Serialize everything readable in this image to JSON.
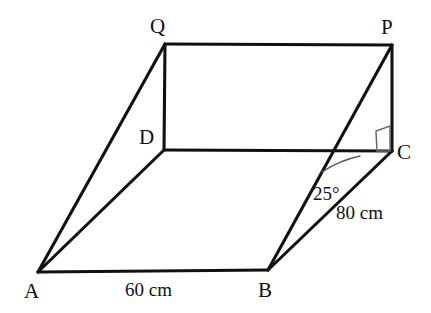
{
  "figure": {
    "stroke_color": "#111111",
    "marker_color": "#6a6a6a",
    "background_color": "#ffffff",
    "vertices": [
      {
        "name": "A",
        "label": "A",
        "x": 38,
        "y": 272
      },
      {
        "name": "B",
        "label": "B",
        "x": 268,
        "y": 270
      },
      {
        "name": "C",
        "label": "C",
        "x": 392,
        "y": 151
      },
      {
        "name": "D",
        "label": "D",
        "x": 164,
        "y": 150
      },
      {
        "name": "P",
        "label": "P",
        "x": 392,
        "y": 45
      },
      {
        "name": "Q",
        "label": "Q",
        "x": 165,
        "y": 44
      }
    ],
    "edges": [
      {
        "name": "edge-AB",
        "from": "A",
        "to": "B"
      },
      {
        "name": "edge-BC",
        "from": "B",
        "to": "C"
      },
      {
        "name": "edge-CD",
        "from": "C",
        "to": "D"
      },
      {
        "name": "edge-DA",
        "from": "D",
        "to": "A"
      },
      {
        "name": "edge-QP",
        "from": "Q",
        "to": "P"
      },
      {
        "name": "edge-QD",
        "from": "Q",
        "to": "D"
      },
      {
        "name": "edge-PC",
        "from": "P",
        "to": "C"
      },
      {
        "name": "edge-AQ",
        "from": "A",
        "to": "Q"
      },
      {
        "name": "edge-BP",
        "from": "B",
        "to": "P"
      }
    ],
    "dimensions": [
      {
        "name": "length-AB",
        "text": "60 cm",
        "value": 60,
        "unit": "cm",
        "edge": "AB"
      },
      {
        "name": "length-BC",
        "text": "80 cm",
        "value": 80,
        "unit": "cm",
        "edge": "BC"
      }
    ],
    "angles": [
      {
        "name": "angle-PBC",
        "text": "25°",
        "value": 25,
        "unit": "degrees",
        "at_vertex": "B",
        "between": [
          "BP",
          "BC"
        ]
      }
    ],
    "right_angle_marks": [
      {
        "name": "right-angle-at-C",
        "at_vertex": "C",
        "between": [
          "CD",
          "CP"
        ]
      }
    ]
  }
}
